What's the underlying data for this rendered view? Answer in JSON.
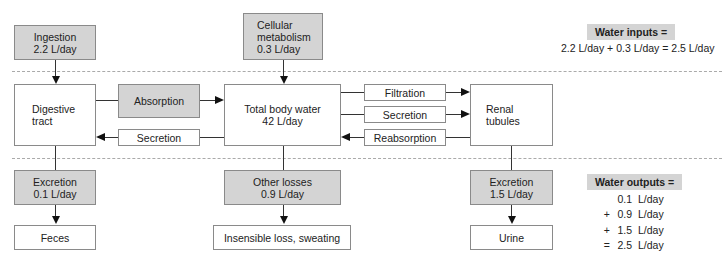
{
  "diagram": {
    "inputs": {
      "ingestion": {
        "line1": "Ingestion",
        "line2": "2.2 L/day"
      },
      "metabolism": {
        "line1": "Cellular",
        "line2": "metabolism",
        "line3": "0.3 L/day"
      }
    },
    "compartments": {
      "digestive": {
        "line1": "Digestive",
        "line2": "tract"
      },
      "body_water": {
        "line1": "Total body water",
        "line2": "42 L/day"
      },
      "renal": {
        "line1": "Renal",
        "line2": "tubules"
      }
    },
    "exchanges": {
      "absorption": "Absorption",
      "secretion_gi": "Secretion",
      "filtration": "Filtration",
      "secretion_renal": "Secretion",
      "reabsorption": "Reabsorption"
    },
    "outputs": {
      "gi_excretion": {
        "line1": "Excretion",
        "line2": "0.1 L/day"
      },
      "other_losses": {
        "line1": "Other losses",
        "line2": "0.9 L/day"
      },
      "renal_excretion": {
        "line1": "Excretion",
        "line2": "1.5 L/day"
      }
    },
    "sinks": {
      "feces": "Feces",
      "insensible": "Insensible loss, sweating",
      "urine": "Urine"
    },
    "summary_inputs": {
      "title": "Water inputs =",
      "equation": "2.2 L/day + 0.3 L/day = 2.5 L/day"
    },
    "summary_outputs": {
      "title": "Water outputs =",
      "rows": [
        {
          "op": "",
          "value": "0.1",
          "unit": "L/day"
        },
        {
          "op": "+",
          "value": "0.9",
          "unit": "L/day"
        },
        {
          "op": "+",
          "value": "1.5",
          "unit": "L/day"
        },
        {
          "op": "=",
          "value": "2.5",
          "unit": "L/day"
        }
      ]
    },
    "colors": {
      "gray_fill": "#d4d4d4",
      "border": "#8a8a8a",
      "dash": "#aaaaaa"
    }
  }
}
